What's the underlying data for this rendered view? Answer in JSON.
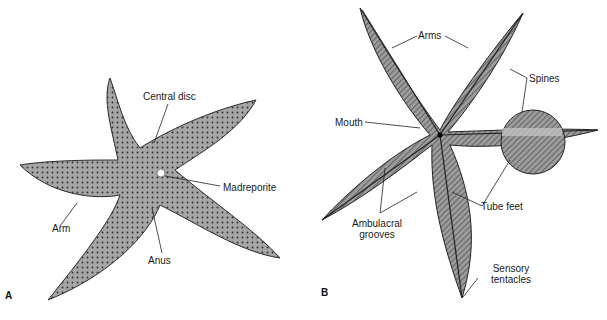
{
  "figure": {
    "panels": [
      {
        "id": "A",
        "letter": "A",
        "view": "aboral (dorsal) surface",
        "labels": {
          "central_disc": "Central disc",
          "madreporite": "Madreporite",
          "arm": "Arm",
          "anus": "Anus"
        }
      },
      {
        "id": "B",
        "letter": "B",
        "view": "oral (ventral) surface",
        "labels": {
          "arms": "Arms",
          "spines": "Spines",
          "mouth": "Mouth",
          "tube_feet": "Tube feet",
          "ambulacral_line1": "Ambulacral",
          "ambulacral_line2": "grooves",
          "sensory_line1": "Sensory",
          "sensory_line2": "tentacles"
        }
      }
    ],
    "colors": {
      "body_fill": "#9a9a9a",
      "body_stroke": "#2a2a2a",
      "groove": "#333333",
      "leader": "#222222"
    }
  }
}
